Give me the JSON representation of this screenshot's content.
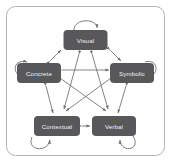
{
  "diagram": {
    "frame": {
      "border_color": "#b3b3b3",
      "background_color": "#ffffff"
    },
    "node_fill_color": "#58585a",
    "node_text_color": "#f2f2f2",
    "edge_color": "#6e6e70",
    "nodes": [
      {
        "id": "visual",
        "label": "Visual",
        "cx": 85.5,
        "cy": 40,
        "w": 44,
        "h": 20
      },
      {
        "id": "concrete",
        "label": "Concrete",
        "cx": 39,
        "cy": 73,
        "w": 44,
        "h": 20
      },
      {
        "id": "symbolic",
        "label": "Symbolic",
        "cx": 132,
        "cy": 73,
        "w": 44,
        "h": 20
      },
      {
        "id": "contextual",
        "label": "Contextual",
        "cx": 57,
        "cy": 126,
        "w": 46,
        "h": 20
      },
      {
        "id": "verbal",
        "label": "Verbal",
        "cx": 114,
        "cy": 126,
        "w": 44,
        "h": 20
      }
    ],
    "perimeter_edges": [
      {
        "from": "concrete",
        "to": "visual",
        "style": "double-arrow"
      },
      {
        "from": "visual",
        "to": "symbolic",
        "style": "double-arrow"
      },
      {
        "from": "symbolic",
        "to": "verbal",
        "style": "double-arrow"
      },
      {
        "from": "verbal",
        "to": "contextual",
        "style": "double-arrow"
      },
      {
        "from": "contextual",
        "to": "concrete",
        "style": "double-arrow"
      }
    ],
    "star_edges": [
      {
        "from": "visual",
        "to": "contextual",
        "style": "double-arrow"
      },
      {
        "from": "visual",
        "to": "verbal",
        "style": "double-arrow"
      },
      {
        "from": "concrete",
        "to": "symbolic",
        "style": "double-arrow"
      },
      {
        "from": "concrete",
        "to": "verbal",
        "style": "double-arrow"
      },
      {
        "from": "symbolic",
        "to": "contextual",
        "style": "double-arrow"
      }
    ],
    "self_loops": [
      {
        "node": "visual",
        "position": "top"
      },
      {
        "node": "concrete",
        "position": "left"
      },
      {
        "node": "symbolic",
        "position": "right"
      },
      {
        "node": "contextual",
        "position": "bottom-left"
      },
      {
        "node": "verbal",
        "position": "bottom-right"
      }
    ]
  }
}
